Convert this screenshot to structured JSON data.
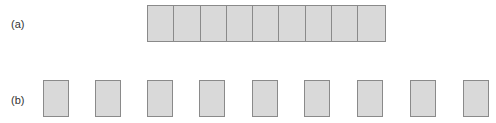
{
  "labels": {
    "a": "(a)",
    "b": "(b)"
  },
  "row_a": {
    "cell_count": 9,
    "fill": "#d9d9d9",
    "stroke": "#8a8a8a"
  },
  "row_b": {
    "box_count": 9,
    "left_positions": [
      43,
      95,
      147,
      199,
      252,
      304,
      357,
      410,
      463
    ],
    "fill": "#d9d9d9",
    "stroke": "#8a8a8a"
  }
}
